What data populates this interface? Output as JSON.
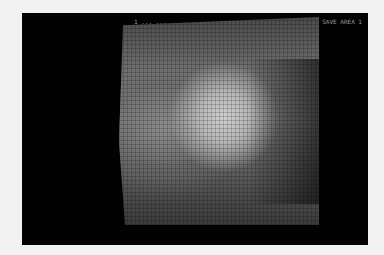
{
  "photo": {
    "subject": "old monitor displaying pixelated grayscale image",
    "header_left": "1  ...  ...  ...",
    "header_right": "SAVE AREA 1"
  },
  "colors": {
    "screen_bg": "#020202",
    "bright_region": "#cfcfcf",
    "mid_region": "#7a7a7a",
    "page_bg": "#f2f2f2"
  }
}
